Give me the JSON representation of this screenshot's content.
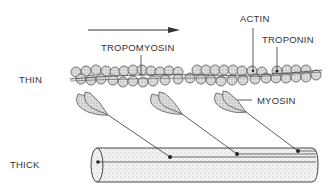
{
  "diagram": {
    "labels": {
      "thin": "THIN",
      "thick": "THICK",
      "actin": "ACTIN",
      "troponin": "TROPONIN",
      "tropomyosin": "TROPOMYOSIN",
      "myosin": "MYOSIN"
    },
    "arrow_direction": "right",
    "myosin_head_count": 3,
    "colors": {
      "line": "#333333",
      "fill_light": "#e4e4e4",
      "background": "#ffffff"
    }
  }
}
